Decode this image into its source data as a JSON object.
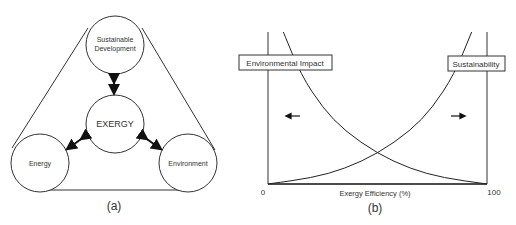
{
  "panel_a": {
    "caption": "(a)",
    "nodes": {
      "top": [
        "Sustainable",
        "Development"
      ],
      "center": "EXERGY",
      "left": "Energy",
      "right": "Environment"
    }
  },
  "panel_b": {
    "caption": "(b)",
    "label_left": "Environmental Impact",
    "label_right": "Sustainability",
    "xlabel": "Exergy Efficiency (%)",
    "x_min_label": "0",
    "x_max_label": "100"
  },
  "chart_data": {
    "type": "line",
    "title": "",
    "xlabel": "Exergy Efficiency (%)",
    "ylabel": "",
    "xlim": [
      0,
      100
    ],
    "x_ticks": [
      "0",
      "100"
    ],
    "series": [
      {
        "name": "Environmental Impact",
        "trend": "decreasing",
        "x": [
          7,
          15,
          25,
          35,
          50,
          65,
          80,
          100
        ],
        "values": [
          1.0,
          0.72,
          0.5,
          0.35,
          0.2,
          0.1,
          0.04,
          0.0
        ]
      },
      {
        "name": "Sustainability",
        "trend": "increasing",
        "x": [
          0,
          20,
          35,
          50,
          65,
          75,
          85,
          93
        ],
        "values": [
          0.0,
          0.04,
          0.1,
          0.2,
          0.35,
          0.5,
          0.72,
          1.0
        ]
      }
    ],
    "annotations": [
      "←",
      "→"
    ],
    "grid": false
  }
}
